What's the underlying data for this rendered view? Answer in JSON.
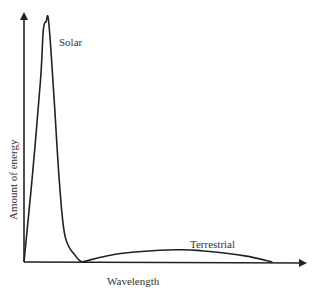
{
  "chart_data": {
    "type": "line",
    "title": "",
    "xlabel": "Wavelength",
    "ylabel": "Amount of energy",
    "xlim": [
      0,
      1
    ],
    "ylim": [
      0,
      1
    ],
    "grid": false,
    "ticks": false,
    "series": [
      {
        "name": "Solar",
        "label": "Solar",
        "x": [
          0.0,
          0.03,
          0.06,
          0.07,
          0.08,
          0.09,
          0.11,
          0.13,
          0.15,
          0.19,
          0.21
        ],
        "y": [
          0.0,
          0.35,
          0.75,
          0.95,
          0.985,
          0.98,
          0.65,
          0.3,
          0.1,
          0.02,
          0.0
        ]
      },
      {
        "name": "Terrestrial",
        "label": "Terrestrial",
        "x": [
          0.21,
          0.35,
          0.55,
          0.65,
          0.8,
          0.9
        ],
        "y": [
          0.0,
          0.035,
          0.05,
          0.045,
          0.025,
          0.0
        ]
      }
    ]
  }
}
